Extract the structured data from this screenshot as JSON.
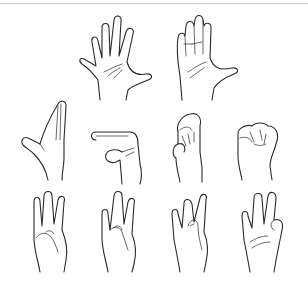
{
  "figure": {
    "rows": [
      {
        "row": 1,
        "hands": [
          "open-palm-spread-fingers",
          "open-palm-fingers-together-thumb-out"
        ]
      },
      {
        "row": 2,
        "hands": [
          "flat-hand-vertical-thumb-out",
          "flat-hand-horizontal-pointing",
          "hand-fingers-bent-thumb-tucked",
          "closed-fist"
        ]
      },
      {
        "row": 3,
        "hands": [
          "three-fingers-up-thumb-holding-index",
          "three-fingers-up-thumb-holding-ring",
          "three-fingers-up-thumb-holding-middle",
          "three-fingers-up-thumb-holding-pinky"
        ]
      }
    ],
    "line_color": "#2a2a2a",
    "background": "#ffffff",
    "border_color": "#cfcfcf"
  }
}
